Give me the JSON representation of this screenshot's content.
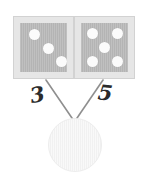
{
  "figure": {
    "kind": "number-bond-diagram",
    "background_color": "#ffffff"
  },
  "cards": [
    {
      "name": "left-dot-card",
      "dot_count": 3,
      "arrangement": "diagonal",
      "frame_color": "#e6e6e6",
      "fill_color": "#b4b4b4",
      "dot_color": "#fbfbfb",
      "dots": [
        {
          "x": 14,
          "y": 11
        },
        {
          "x": 28,
          "y": 25
        },
        {
          "x": 41,
          "y": 38
        }
      ]
    },
    {
      "name": "right-dot-card",
      "dot_count": 5,
      "arrangement": "quincunx",
      "frame_color": "#e6e6e6",
      "fill_color": "#b4b4b4",
      "dot_color": "#fbfbfb",
      "dots": [
        {
          "x": 11,
          "y": 10
        },
        {
          "x": 36,
          "y": 10
        },
        {
          "x": 23,
          "y": 24
        },
        {
          "x": 11,
          "y": 38
        },
        {
          "x": 36,
          "y": 38
        }
      ]
    }
  ],
  "connectors": {
    "stroke_color": "#8f8f8f",
    "stroke_width": 1.6,
    "left_line": {
      "x1": 46,
      "y1": 80,
      "x2": 74,
      "y2": 121
    },
    "right_line": {
      "x1": 103,
      "y1": 80,
      "x2": 75,
      "y2": 121
    }
  },
  "labels": {
    "left_addend": "3",
    "right_addend": "5",
    "text_color": "#2b2b2b"
  },
  "sum_circle": {
    "name": "sum-answer-circle",
    "value": "",
    "state": "empty",
    "fill_color": "#f1f1f1",
    "border_color": "#ededed",
    "diameter_px": 54
  }
}
